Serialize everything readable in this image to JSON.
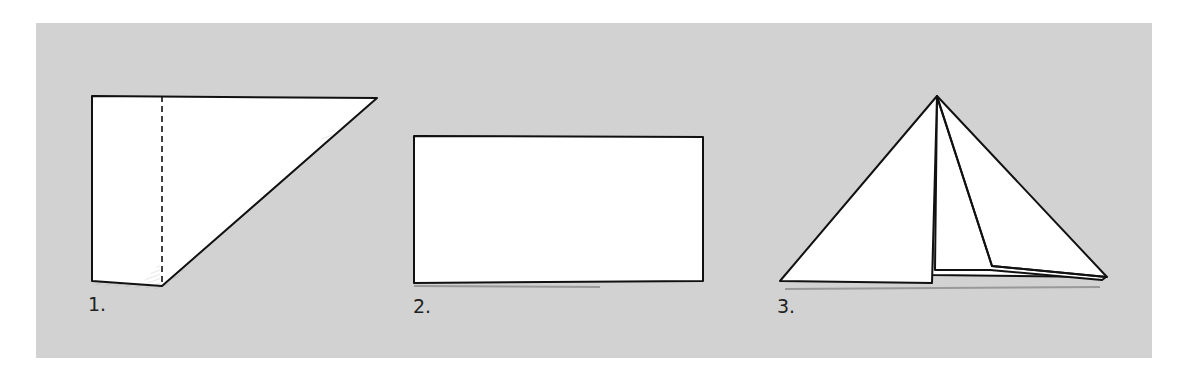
{
  "diagram": {
    "type": "origami-folding-steps",
    "background_color": "#d2d2d2",
    "paper_color": "#ffffff",
    "line_color": "#111111",
    "steps": [
      {
        "number": 1,
        "label": "1.",
        "shape": "trapezoid-with-dashed-fold-line",
        "description": "Paper folded diagonally with a vertical dashed fold line"
      },
      {
        "number": 2,
        "label": "2.",
        "shape": "rectangle",
        "description": "Unfolded rectangle of paper"
      },
      {
        "number": 3,
        "label": "3.",
        "shape": "folded-triangle",
        "description": "Paper folded into a triangular hat/tent shape"
      }
    ]
  }
}
